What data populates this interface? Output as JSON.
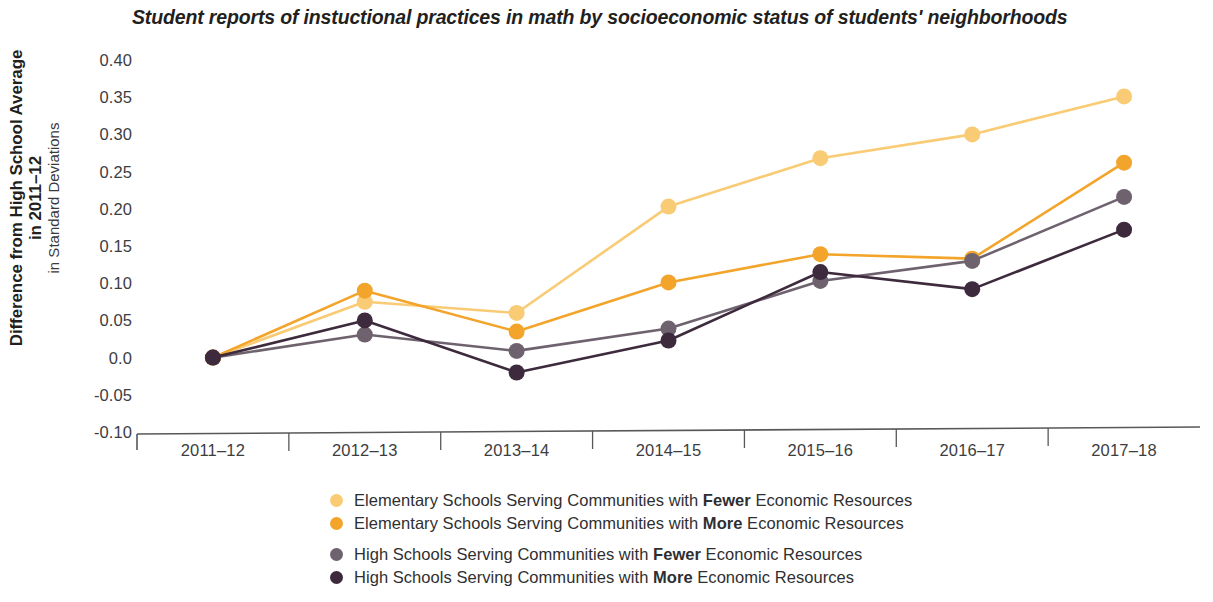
{
  "chart_data": {
    "type": "line",
    "title": "Student reports of instuctional practices in math by socioeconomic status of students' neighborhoods",
    "xlabel": "",
    "ylabel": "Difference from High School Average in 2011–12",
    "ylabel_sub": "in Standard Deviations",
    "categories": [
      "2011–12",
      "2012–13",
      "2013–14",
      "2014–15",
      "2015–16",
      "2016–17",
      "2017–18"
    ],
    "ylim": [
      -0.1,
      0.4
    ],
    "yticks": [
      0.4,
      0.35,
      0.3,
      0.25,
      0.2,
      0.15,
      0.1,
      0.05,
      0.0,
      -0.05,
      -0.1
    ],
    "ytick_labels": [
      "0.40",
      "0.35",
      "0.30",
      "0.25",
      "0.20",
      "0.15",
      "0.10",
      "0.05",
      "0.0",
      "-0.05",
      "-0.10"
    ],
    "grid": false,
    "legend_position": "bottom",
    "series": [
      {
        "name": "Elementary Schools Serving Communities with Fewer Economic Resources",
        "name_prefix": "Elementary Schools Serving Communities with ",
        "name_emphasis": "Fewer",
        "name_suffix": " Economic Resources",
        "color": "#F9CB74",
        "values": [
          0.0,
          0.075,
          0.06,
          0.203,
          0.268,
          0.3,
          0.351
        ]
      },
      {
        "name": "Elementary Schools Serving Communities with More Economic Resources",
        "name_prefix": "Elementary Schools Serving Communities with ",
        "name_emphasis": "More",
        "name_suffix": " Economic Resources",
        "color": "#F3A42A",
        "values": [
          0.0,
          0.09,
          0.035,
          0.101,
          0.139,
          0.133,
          0.262
        ]
      },
      {
        "name": "High Schools Serving Communities with Fewer Economic Resources",
        "name_prefix": "High Schools Serving Communities with ",
        "name_emphasis": "Fewer",
        "name_suffix": " Economic Resources",
        "color": "#6E626F",
        "values": [
          0.0,
          0.031,
          0.009,
          0.039,
          0.103,
          0.13,
          0.216
        ]
      },
      {
        "name": "High Schools Serving Communities with More Economic Resources",
        "name_prefix": "High Schools Serving Communities with ",
        "name_emphasis": "More",
        "name_suffix": " Economic Resources",
        "color": "#3D2B3D",
        "values": [
          0.0,
          0.05,
          -0.02,
          0.023,
          0.115,
          0.092,
          0.172
        ]
      }
    ]
  },
  "axis": {
    "line_color": "#58585a"
  }
}
